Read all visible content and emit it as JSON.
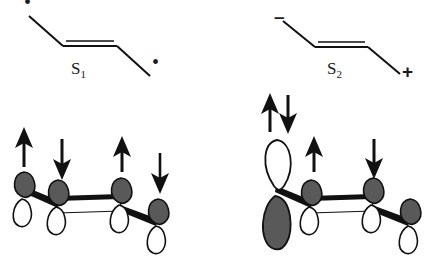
{
  "figure": {
    "background_color": "#ffffff",
    "line_color": "#111111",
    "lobe_fill_dark": "#595959",
    "lobe_fill_light": "#ffffff",
    "lobe_stroke": "#111111"
  },
  "panels": [
    {
      "id": "s1",
      "state_label": "S",
      "state_sub": "1",
      "skeleton": {
        "type": "butadiene-zigzag",
        "double_bond_segment": "central",
        "terminus_left_marker": "radical-dot",
        "terminus_right_marker": "radical-dot",
        "left_marker_text": "•",
        "right_marker_text": "•"
      },
      "orbitals": [
        {
          "index": 1,
          "phase": "dark-up",
          "top_lobe": "dark",
          "bottom_lobe": "light",
          "size": "normal"
        },
        {
          "index": 2,
          "phase": "dark-up",
          "top_lobe": "dark",
          "bottom_lobe": "light",
          "size": "normal"
        },
        {
          "index": 3,
          "phase": "dark-up",
          "top_lobe": "dark",
          "bottom_lobe": "light",
          "size": "normal"
        },
        {
          "index": 4,
          "phase": "dark-up",
          "top_lobe": "dark",
          "bottom_lobe": "light",
          "size": "normal"
        }
      ],
      "spin_arrows": [
        {
          "index": 1,
          "direction": "up",
          "paired": false
        },
        {
          "index": 2,
          "direction": "down",
          "paired": false
        },
        {
          "index": 3,
          "direction": "up",
          "paired": false
        },
        {
          "index": 4,
          "direction": "down",
          "paired": false
        }
      ]
    },
    {
      "id": "s2",
      "state_label": "S",
      "state_sub": "2",
      "skeleton": {
        "type": "butadiene-zigzag",
        "double_bond_segment": "central",
        "terminus_left_marker": "negative-charge",
        "terminus_right_marker": "positive-charge",
        "left_marker_text": "–",
        "right_marker_text": "+"
      },
      "orbitals": [
        {
          "index": 1,
          "phase": "light-up",
          "top_lobe": "light",
          "bottom_lobe": "dark",
          "size": "large"
        },
        {
          "index": 2,
          "phase": "dark-up",
          "top_lobe": "dark",
          "bottom_lobe": "light",
          "size": "normal"
        },
        {
          "index": 3,
          "phase": "dark-up",
          "top_lobe": "dark",
          "bottom_lobe": "light",
          "size": "normal"
        },
        {
          "index": 4,
          "phase": "dark-up",
          "top_lobe": "dark",
          "bottom_lobe": "light",
          "size": "normal"
        }
      ],
      "spin_arrows": [
        {
          "index": 1,
          "direction": "up-down-pair",
          "paired": true
        },
        {
          "index": 2,
          "direction": "up",
          "paired": false
        },
        {
          "index": 3,
          "direction": "down",
          "paired": false
        },
        {
          "index": 4,
          "direction": "none",
          "paired": false
        }
      ]
    }
  ]
}
